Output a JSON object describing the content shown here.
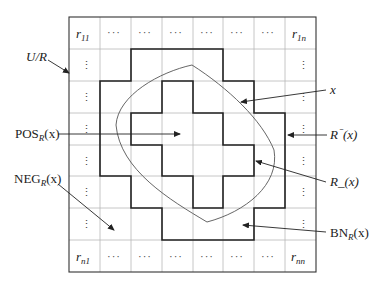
{
  "diagram": {
    "grid": {
      "rows": 8,
      "cols": 8,
      "origin_x": 69,
      "origin_y": 17,
      "cell_w": 30.875,
      "cell_h": 31.875,
      "corner_labels": {
        "top_left": {
          "base": "r",
          "sub": "11"
        },
        "top_right": {
          "base": "r",
          "sub": "1n"
        },
        "bottom_left": {
          "base": "r",
          "sub": "n1"
        },
        "bottom_right": {
          "base": "r",
          "sub": "nn"
        }
      },
      "horizontal_ellipsis": "···",
      "vertical_ellipsis": "⋮"
    },
    "labels": {
      "universe": "U/R",
      "set": "x",
      "positive_region": {
        "base": "POS",
        "sub": "R",
        "arg": "(x)"
      },
      "negative_region": {
        "base": "NEG",
        "sub": "R",
        "arg": "(x)"
      },
      "upper_approx": {
        "base": "R",
        "sup": "⁻",
        "arg": "(x)"
      },
      "lower_approx": {
        "base": "R",
        "sub": "_",
        "arg": "(x)"
      },
      "boundary_region": {
        "base": "BN",
        "sub": "R",
        "arg": "(x)"
      }
    },
    "colors": {
      "grid": "#b8b8b8",
      "frame": "#333333",
      "approx_outline": "#222222",
      "set_curve": "#555555"
    }
  }
}
